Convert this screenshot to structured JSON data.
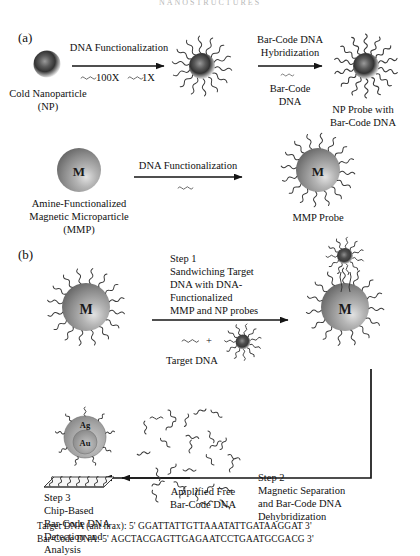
{
  "figure": {
    "header": "NANOSTRUCTURES",
    "panels": [
      {
        "id": "a",
        "label": "(a)"
      },
      {
        "id": "b",
        "label": "(b)"
      }
    ]
  },
  "panel_a": {
    "nanoparticle": {
      "caption_line1": "Cold Nanoparticle",
      "caption_line2": "(NP)"
    },
    "arrow1": {
      "above": "DNA Functionalization",
      "below_left": "100X",
      "below_right": "1X"
    },
    "arrow2": {
      "above_line1": "Bar-Code DNA",
      "above_line2": "Hybridization",
      "below_line1": "Bar-Code",
      "below_line2": "DNA"
    },
    "np_probe": {
      "caption_line1": "NP Probe with",
      "caption_line2": "Bar-Code DNA"
    },
    "mmp": {
      "core_label": "M",
      "caption_line1": "Amine-Functionalized",
      "caption_line2": "Magnetic Microparticle",
      "caption_line3": "(MMP)"
    },
    "arrow3": {
      "above": "DNA Functionalization"
    },
    "mmp_probe": {
      "core_label": "M",
      "caption": "MMP Probe"
    }
  },
  "panel_b": {
    "mmp_probe_core_label": "M",
    "step1": {
      "line1": "Step 1",
      "line2": "Sandwiching Target",
      "line3": "DNA with DNA-",
      "line4": "Functionalized",
      "line5": "MMP and NP probes"
    },
    "reagents": {
      "plus": "+",
      "target_dna_label": "Target DNA"
    },
    "sandwich_core_label": "M",
    "step2": {
      "line1": "Step 2",
      "line2": "Magnetic Separation",
      "line3": "and Bar-Code DNA",
      "line4": "Dehybridization"
    },
    "free_barcode": {
      "line1": "Amplified Free",
      "line2": "Bar-Code DNA"
    },
    "step3": {
      "line1": "Step 3",
      "line2": "Chip-Based",
      "line3": "Bar-Code DNA",
      "line4": "Detection and",
      "line5": "Analysis"
    },
    "chip_particle": {
      "shell_label": "Ag",
      "core_label": "Au"
    }
  },
  "sequences": {
    "target": "Target DNA (ant hrax): 5' GGATTATTGTTAAATATTGATAAGGAT 3'",
    "barcode": "Bar-Code DNA: 5' AGCTACGAGTTGAGAATCCTGAATGCGACG 3'"
  },
  "colors": {
    "ink": "#101010",
    "strand": "#3b3b3b",
    "sphere_dark": "#2b2b2b",
    "sphere_grey": "#8d8d8d",
    "sphere_light": "#d8d8d8",
    "background": "#ffffff"
  }
}
